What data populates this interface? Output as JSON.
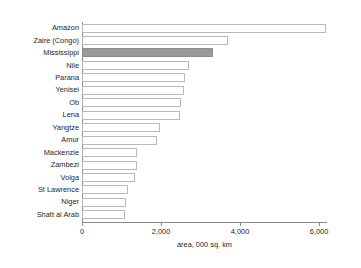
{
  "chart_data": {
    "type": "bar",
    "orientation": "horizontal",
    "title": "",
    "subtitle": "",
    "xlabel": "area, 000 sq. km",
    "ylabel": "",
    "xlim": [
      0,
      6600
    ],
    "xticks": [
      0,
      2000,
      4000,
      6000
    ],
    "xticklabels": [
      "0",
      "2,000",
      "4,000",
      "6,000"
    ],
    "grid": false,
    "legend": null,
    "categories": [
      "Amazon",
      "Zaire (Congo)",
      "Mississippi",
      "Nile",
      "Parana",
      "Yenisei",
      "Ob",
      "Lena",
      "Yangtze",
      "Amur",
      "Mackenzie",
      "Zambezi",
      "Volga",
      "St Lawrence",
      "Niger",
      "Shatt al Arab"
    ],
    "values": [
      6180,
      3700,
      3320,
      2700,
      2600,
      2590,
      2500,
      2480,
      1970,
      1900,
      1400,
      1390,
      1340,
      1160,
      1110,
      1090
    ],
    "highlight_category": "Mississippi",
    "colors": {
      "bar_fill": "#ffffff",
      "bar_edge": "#b9b9b9",
      "highlight_fill": "#999999",
      "highlight_edge": "#8d8d8d",
      "axis": "#8a8a8a",
      "text": "#262626",
      "background": "#ffffff"
    }
  }
}
